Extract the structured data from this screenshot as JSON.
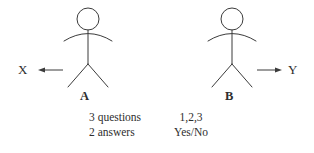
{
  "diagram": {
    "background_color": "#ffffff",
    "line_color": "#3b3b3b",
    "text_color": "#2e2e2e",
    "actors": [
      {
        "id": "actor-a",
        "label": "A",
        "position": "left",
        "head_center_x": 88,
        "head_center_y": 19,
        "head_radius": 11
      },
      {
        "id": "actor-b",
        "label": "B",
        "position": "right",
        "head_center_x": 232,
        "head_center_y": 19,
        "head_radius": 11
      }
    ],
    "arrows": [
      {
        "id": "arrow-x",
        "label": "X",
        "direction": "left",
        "from_actor": "A",
        "glyph": "arrow-left"
      },
      {
        "id": "arrow-y",
        "label": "Y",
        "direction": "right",
        "from_actor": "B",
        "glyph": "arrow-right"
      }
    ],
    "notes": {
      "rows": [
        {
          "quantity": "3 questions",
          "values": "1,2,3"
        },
        {
          "quantity": "2 answers",
          "values": "Yes/No"
        }
      ]
    }
  }
}
